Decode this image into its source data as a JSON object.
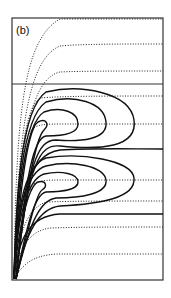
{
  "figure": {
    "panel_label": "(b)",
    "frame": {
      "x": 12,
      "y": 18,
      "width": 151,
      "height": 262
    },
    "divider_y": 84,
    "origin": {
      "x": 14,
      "y": 279
    },
    "colors": {
      "line": "#111111",
      "frame": "#333333",
      "background": "#ffffff"
    },
    "top_panel_dotted_asymptotes_y": [
      19,
      44,
      71
    ],
    "bottom_panel_dotted_asymptotes_y": [
      96,
      124,
      180,
      201,
      227,
      254
    ],
    "bottom_panel_solid_asymptotes_y": [
      149,
      214
    ],
    "closed_loop_groups": [
      {
        "center_y": 124,
        "loops": 4
      },
      {
        "center_y": 180,
        "loops": 4
      }
    ]
  }
}
